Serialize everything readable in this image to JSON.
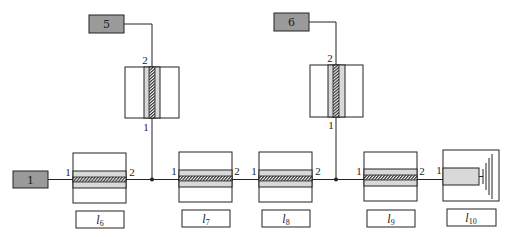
{
  "diagram": {
    "type": "transmission-line-network",
    "sources": [
      {
        "id": "src-1",
        "label": "1"
      },
      {
        "id": "src-5",
        "label": "5"
      },
      {
        "id": "src-6",
        "label": "6"
      }
    ],
    "horizontal_lines": [
      {
        "id": "l6",
        "label_main": "l",
        "label_sub": "6",
        "port_in": "1",
        "port_out": "2"
      },
      {
        "id": "l7",
        "label_main": "l",
        "label_sub": "7",
        "port_in": "1",
        "port_out": "2"
      },
      {
        "id": "l8",
        "label_main": "l",
        "label_sub": "8",
        "port_in": "1",
        "port_out": "2"
      },
      {
        "id": "l9",
        "label_main": "l",
        "label_sub": "9",
        "port_in": "1",
        "port_out": "2"
      }
    ],
    "terminal": {
      "id": "l10",
      "label_main": "l",
      "label_sub": "10",
      "port_in": "1"
    },
    "vertical_stubs": [
      {
        "id": "stub-5",
        "source": "5",
        "port_top": "2",
        "port_bottom": "1"
      },
      {
        "id": "stub-6",
        "source": "6",
        "port_top": "2",
        "port_bottom": "1"
      }
    ],
    "colors": {
      "source_fill": "#9a9a9a",
      "dielectric_fill": "#d9d9d9",
      "line": "#222222"
    }
  }
}
